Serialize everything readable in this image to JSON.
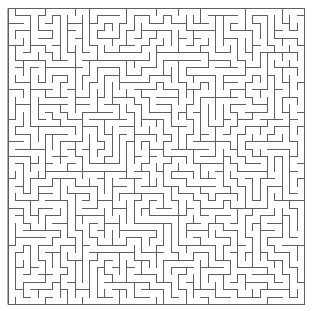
{
  "figure": {
    "type": "maze"
  },
  "canvas": {
    "width": 313,
    "height": 311,
    "background_color": "#ffffff"
  },
  "maze": {
    "columns": 40,
    "rows": 40,
    "cell_size": 7.4,
    "origin_x": 8,
    "origin_y": 8,
    "span_x": 296,
    "span_y": 296,
    "wall_color": "#5f5f5f",
    "wall_thickness": 1,
    "border": true,
    "border_color": "#5f5f5f",
    "openings": 0,
    "algorithm": "depth-first-search",
    "seed": 20240917
  }
}
